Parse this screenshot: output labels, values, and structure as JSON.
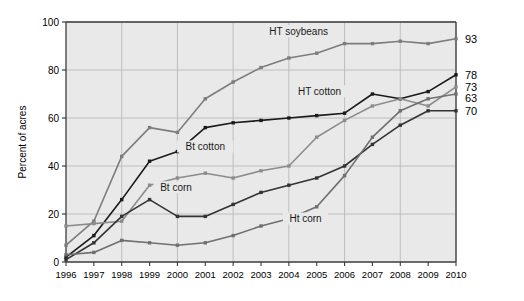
{
  "chart_data": {
    "type": "line",
    "title": "",
    "xlabel": "",
    "ylabel": "Percent of acres",
    "x": [
      1996,
      1997,
      1998,
      1999,
      2000,
      2001,
      2002,
      2003,
      2004,
      2005,
      2006,
      2007,
      2008,
      2009,
      2010
    ],
    "xtick_labels": [
      "1996",
      "1997",
      "1998",
      "1999",
      "2000",
      "2001",
      "2002",
      "2003",
      "2004",
      "2005",
      "2006",
      "2007",
      "2008",
      "2009",
      "2010"
    ],
    "ylim": [
      0,
      100
    ],
    "ytick_labels": [
      "0",
      "20",
      "40",
      "60",
      "80",
      "100"
    ],
    "yticks": [
      0,
      20,
      40,
      60,
      80,
      100
    ],
    "grid": true,
    "legend_position": "inline-annotations",
    "series": [
      {
        "name": "HT soybeans",
        "color": "#7d7d7d",
        "end_value_label": "93",
        "label_x": 2004.35,
        "label_y": 95.5,
        "values": [
          7,
          17,
          44,
          56,
          54,
          68,
          75,
          81,
          85,
          87,
          91,
          91,
          92,
          91,
          93
        ]
      },
      {
        "name": "HT cotton",
        "color": "#1a1a1a",
        "end_value_label": "78",
        "label_x": 2005.1,
        "label_y": 70.5,
        "values": [
          2,
          11,
          26,
          42,
          46,
          56,
          58,
          59,
          60,
          61,
          62,
          70,
          68,
          71,
          78
        ]
      },
      {
        "name": "Bt cotton",
        "color": "#8c8c8c",
        "end_value_label": "73",
        "label_x": 2001.0,
        "label_y": 47.5,
        "values": [
          15,
          16,
          17,
          32,
          35,
          37,
          35,
          38,
          40,
          52,
          59,
          65,
          68,
          65,
          73
        ]
      },
      {
        "name": "Bt corn",
        "color": "#333333",
        "end_value_label": "70",
        "label_x": 1999.95,
        "label_y": 30.5,
        "values": [
          1,
          8,
          19,
          26,
          19,
          19,
          24,
          29,
          32,
          35,
          40,
          49,
          57,
          63,
          63
        ]
      },
      {
        "name": "Ht corn",
        "color": "#6f6f6f",
        "end_value_label": "63",
        "label_x": 2004.6,
        "label_y": 17.5,
        "values": [
          3,
          4,
          9,
          8,
          7,
          8,
          11,
          15,
          18,
          23,
          36,
          52,
          63,
          68,
          70
        ]
      }
    ],
    "end_labels": [
      {
        "text": "93",
        "value": 93
      },
      {
        "text": "78",
        "value": 78
      },
      {
        "text": "73",
        "value": 73
      },
      {
        "text": "70",
        "value": 70
      },
      {
        "text": "63",
        "value": 63
      }
    ]
  },
  "colors": {
    "plot_background": "#e9e9e9",
    "grid": "#b9b9b9",
    "axis": "#3c3c3c",
    "text": "#000000",
    "page_background": "#ffffff"
  }
}
